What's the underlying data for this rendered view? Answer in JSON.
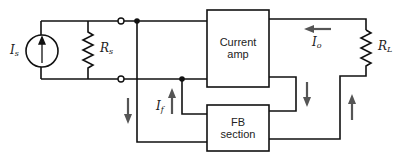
{
  "diagram": {
    "blocks": {
      "amp": {
        "line1": "Current",
        "line2": "amp"
      },
      "fb": {
        "line1": "FB",
        "line2": "section"
      }
    },
    "labels": {
      "source": {
        "main": "I",
        "sub": "s"
      },
      "source_resistor": {
        "main": "R",
        "sub": "s"
      },
      "load_resistor": {
        "main": "R",
        "sub": "L"
      },
      "output_current": {
        "main": "I",
        "sub": "o"
      },
      "feedback_current": {
        "main": "I",
        "sub": "f"
      }
    },
    "colors": {
      "wire": "#111111",
      "arrow": "#555555",
      "background": "#ffffff"
    }
  }
}
